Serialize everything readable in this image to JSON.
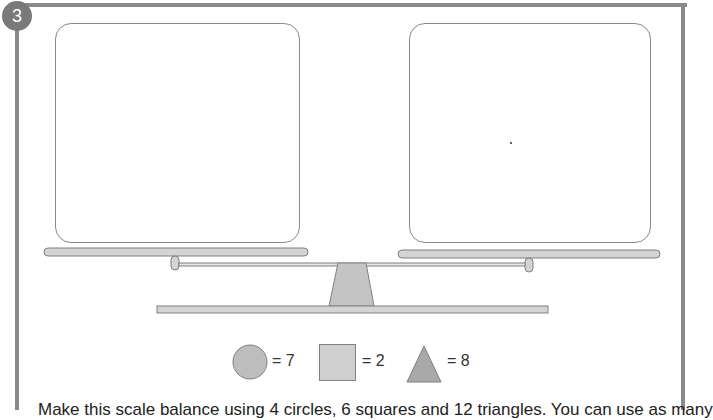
{
  "question_number": "3",
  "scale": {
    "left_pan_contents": "",
    "right_pan_contents": ""
  },
  "key": [
    {
      "shape": "circle",
      "label": "= 7"
    },
    {
      "shape": "square",
      "label": "= 2"
    },
    {
      "shape": "triangle",
      "label": "= 8"
    }
  ],
  "instruction": "Make this scale balance using 4 circles, 6 squares and 12 triangles. You can use as many"
}
